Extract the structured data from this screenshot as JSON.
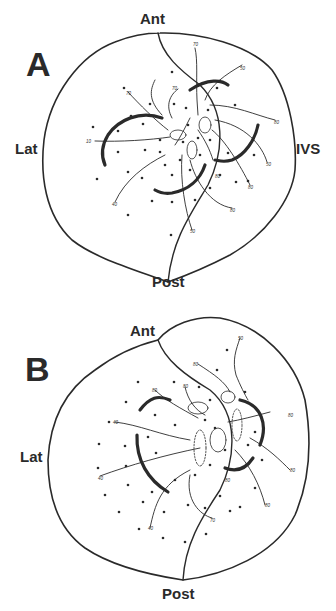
{
  "figure": {
    "panels": [
      {
        "id": "A",
        "letter": "A",
        "labels": {
          "ant": "Ant",
          "post": "Post",
          "lat": "Lat",
          "ivs": "IVS"
        },
        "isochrone_labels": [
          "70",
          "50",
          "70",
          "10",
          "80",
          "50",
          "80",
          "70",
          "80",
          "40",
          "80",
          "50"
        ]
      },
      {
        "id": "B",
        "letter": "B",
        "labels": {
          "ant": "Ant",
          "post": "Post",
          "lat": "Lat"
        },
        "isochrone_labels": [
          "50",
          "80",
          "80",
          "80",
          "40",
          "40",
          "80",
          "80",
          "80",
          "40",
          "70",
          "80"
        ]
      }
    ],
    "colors": {
      "ink": "#2a2a2a",
      "background": "#ffffff"
    }
  }
}
